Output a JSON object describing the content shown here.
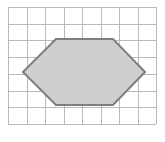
{
  "figure": {
    "canvas": {
      "width": 165,
      "height": 142,
      "background": "#ffffff"
    },
    "grid": {
      "label": "square-grid",
      "origin_x": 8,
      "origin_y": 7,
      "columns": 8,
      "rows": 7,
      "cell_width": 18.5,
      "cell_height": 16.7,
      "line_color": "#b9b9b9",
      "line_width": 1,
      "visible": true
    },
    "shape": {
      "label": "hexagon",
      "type": "polygon",
      "sides": 6,
      "fill_color": "#cfcfcf",
      "stroke_color": "#7f7f7f",
      "stroke_width": 2,
      "vertices": [
        {
          "name": "left",
          "x": 23,
          "y": 72,
          "grid_col": 0.8,
          "grid_row": 3.9
        },
        {
          "name": "top-left",
          "x": 56,
          "y": 39,
          "grid_col": 2.6,
          "grid_row": 1.9
        },
        {
          "name": "top-right",
          "x": 113,
          "y": 39,
          "grid_col": 5.7,
          "grid_row": 1.9
        },
        {
          "name": "right",
          "x": 145,
          "y": 72,
          "grid_col": 7.4,
          "grid_row": 3.9
        },
        {
          "name": "bottom-right",
          "x": 113,
          "y": 105,
          "grid_col": 5.7,
          "grid_row": 5.9
        },
        {
          "name": "bottom-left",
          "x": 56,
          "y": 105,
          "grid_col": 2.6,
          "grid_row": 5.9
        }
      ],
      "points_attr": "23,72 56,39 113,39 145,72 113,105 56,105"
    }
  },
  "chart_data": {
    "type": "scatter",
    "xlabel": "",
    "ylabel": "",
    "xlim": [
      0,
      8
    ],
    "ylim": [
      0,
      7
    ],
    "grid": true,
    "legend": "none",
    "series": [
      {
        "name": "hexagon",
        "x": [
          0.8,
          2.6,
          5.7,
          7.4,
          5.7,
          2.6,
          0.8
        ],
        "y": [
          3.1,
          5.1,
          5.1,
          3.1,
          1.1,
          1.1,
          3.1
        ]
      }
    ],
    "annotations": []
  }
}
